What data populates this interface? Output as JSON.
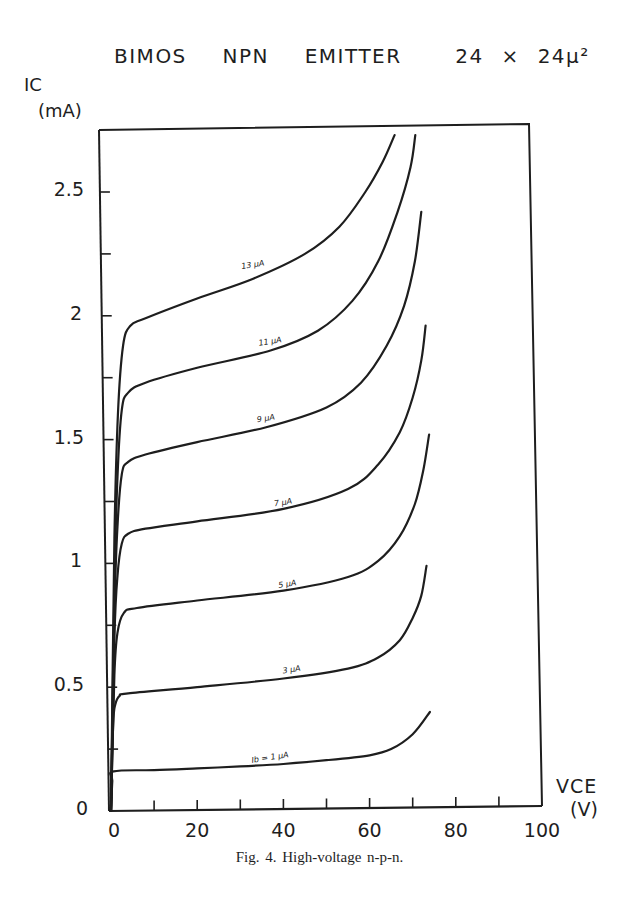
{
  "figure": {
    "title": "BIMOS  NPN  EMITTER   24 × 24µ²",
    "caption": "Fig. 4.  High-voltage n-p-n.",
    "ylabel_line1": "IC",
    "ylabel_line2": "(mA)",
    "xlabel_line1": "VCE",
    "xlabel_line2": "(V)"
  },
  "chart_data": {
    "type": "line",
    "title": "BIMOS NPN EMITTER 24 × 24µ²",
    "xlabel": "VCE (V)",
    "ylabel": "IC (mA)",
    "xlim": [
      0,
      100
    ],
    "ylim": [
      0,
      2.75
    ],
    "grid": false,
    "legend_position": "inline labels on curves",
    "x_ticks": [
      0,
      20,
      40,
      60,
      80,
      100
    ],
    "x_minor_ticks": [
      10,
      30,
      50,
      70,
      90
    ],
    "y_ticks": [
      0,
      0.5,
      1,
      1.5,
      2,
      2.5
    ],
    "y_tick_labels": [
      "0",
      "0.5",
      "1",
      "1.5",
      "2",
      "2.5"
    ],
    "y_minor_ticks": [
      0.25,
      0.75,
      1.25,
      1.75,
      2.25
    ],
    "series": [
      {
        "name": "Ib = 1 µA",
        "label_at": [
          37,
          0.19
        ],
        "points": [
          [
            0,
            0
          ],
          [
            0.3,
            0.12
          ],
          [
            0.6,
            0.16
          ],
          [
            10,
            0.165
          ],
          [
            20,
            0.172
          ],
          [
            30,
            0.18
          ],
          [
            40,
            0.19
          ],
          [
            50,
            0.205
          ],
          [
            60,
            0.225
          ],
          [
            65,
            0.25
          ],
          [
            70,
            0.31
          ],
          [
            74,
            0.4
          ]
        ]
      },
      {
        "name": "3 µA",
        "label_at": [
          42,
          0.545
        ],
        "points": [
          [
            0,
            0
          ],
          [
            0.5,
            0.35
          ],
          [
            1,
            0.43
          ],
          [
            2,
            0.465
          ],
          [
            4,
            0.475
          ],
          [
            20,
            0.5
          ],
          [
            40,
            0.535
          ],
          [
            55,
            0.575
          ],
          [
            62,
            0.62
          ],
          [
            67,
            0.69
          ],
          [
            70,
            0.78
          ],
          [
            72,
            0.87
          ],
          [
            73.2,
            0.99
          ]
        ]
      },
      {
        "name": "5 µA",
        "label_at": [
          41,
          0.89
        ],
        "points": [
          [
            0,
            0
          ],
          [
            0.8,
            0.55
          ],
          [
            1.5,
            0.72
          ],
          [
            3,
            0.8
          ],
          [
            6,
            0.82
          ],
          [
            20,
            0.85
          ],
          [
            40,
            0.89
          ],
          [
            55,
            0.945
          ],
          [
            62,
            1.01
          ],
          [
            67,
            1.11
          ],
          [
            70.5,
            1.24
          ],
          [
            72.5,
            1.38
          ],
          [
            73.8,
            1.52
          ]
        ]
      },
      {
        "name": "7 µA",
        "label_at": [
          40,
          1.22
        ],
        "points": [
          [
            0,
            0
          ],
          [
            0.8,
            0.7
          ],
          [
            1.5,
            0.95
          ],
          [
            2.5,
            1.08
          ],
          [
            4,
            1.12
          ],
          [
            8,
            1.14
          ],
          [
            20,
            1.17
          ],
          [
            40,
            1.22
          ],
          [
            55,
            1.3
          ],
          [
            62,
            1.4
          ],
          [
            67,
            1.53
          ],
          [
            70,
            1.67
          ],
          [
            72,
            1.82
          ],
          [
            73,
            1.96
          ]
        ]
      },
      {
        "name": "9 µA",
        "label_at": [
          36,
          1.56
        ],
        "points": [
          [
            0,
            0
          ],
          [
            0.8,
            0.8
          ],
          [
            1.5,
            1.15
          ],
          [
            2.5,
            1.36
          ],
          [
            4,
            1.41
          ],
          [
            8,
            1.44
          ],
          [
            20,
            1.49
          ],
          [
            36,
            1.55
          ],
          [
            50,
            1.63
          ],
          [
            58,
            1.73
          ],
          [
            64,
            1.88
          ],
          [
            68,
            2.04
          ],
          [
            70.5,
            2.22
          ],
          [
            72,
            2.42
          ]
        ]
      },
      {
        "name": "11 µA",
        "label_at": [
          37,
          1.87
        ],
        "points": [
          [
            0,
            0
          ],
          [
            0.8,
            0.9
          ],
          [
            1.5,
            1.35
          ],
          [
            2.5,
            1.62
          ],
          [
            4,
            1.69
          ],
          [
            8,
            1.73
          ],
          [
            20,
            1.79
          ],
          [
            37,
            1.86
          ],
          [
            48,
            1.94
          ],
          [
            56,
            2.06
          ],
          [
            62,
            2.22
          ],
          [
            66.5,
            2.42
          ],
          [
            69.5,
            2.6
          ],
          [
            70.6,
            2.73
          ]
        ]
      },
      {
        "name": "13 µA",
        "label_at": [
          33,
          2.18
        ],
        "points": [
          [
            0,
            0
          ],
          [
            0.8,
            1.1
          ],
          [
            1.6,
            1.6
          ],
          [
            2.8,
            1.88
          ],
          [
            4.5,
            1.96
          ],
          [
            8,
            1.99
          ],
          [
            20,
            2.07
          ],
          [
            33,
            2.15
          ],
          [
            45,
            2.25
          ],
          [
            53,
            2.36
          ],
          [
            59,
            2.5
          ],
          [
            63,
            2.62
          ],
          [
            65.8,
            2.73
          ]
        ]
      }
    ]
  }
}
